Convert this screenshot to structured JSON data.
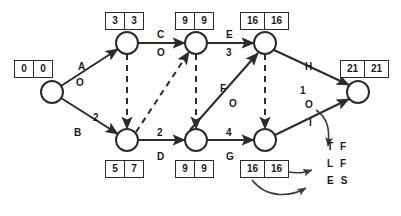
{
  "diagram": {
    "type": "cpm-network",
    "stroke_color": "#2b2b2b",
    "text_color": "#1a1a1a",
    "background": "#ffffff",
    "nodes": [
      {
        "id": "n1",
        "label": "",
        "x": 52,
        "y": 92,
        "r": 11
      },
      {
        "id": "n2",
        "label": "",
        "x": 127,
        "y": 43,
        "r": 11
      },
      {
        "id": "n3",
        "label": "",
        "x": 196,
        "y": 43,
        "r": 11
      },
      {
        "id": "n4",
        "label": "",
        "x": 265,
        "y": 43,
        "r": 11
      },
      {
        "id": "n5",
        "label": "",
        "x": 358,
        "y": 92,
        "r": 11
      },
      {
        "id": "n6",
        "label": "",
        "x": 127,
        "y": 140,
        "r": 11
      },
      {
        "id": "n7",
        "label": "",
        "x": 196,
        "y": 140,
        "r": 11
      },
      {
        "id": "n8",
        "label": "",
        "x": 265,
        "y": 140,
        "r": 11
      }
    ],
    "boxes": [
      {
        "id": "b1",
        "node": "n1",
        "early_start": "0",
        "late_finish": "0",
        "x": 14,
        "y": 60,
        "wide": false
      },
      {
        "id": "b2",
        "node": "n2",
        "early_start": "3",
        "late_finish": "3",
        "x": 105,
        "y": 12,
        "wide": false
      },
      {
        "id": "b3",
        "node": "n3",
        "early_start": "9",
        "late_finish": "9",
        "x": 175,
        "y": 12,
        "wide": false
      },
      {
        "id": "b4",
        "node": "n4",
        "early_start": "16",
        "late_finish": "16",
        "x": 240,
        "y": 12,
        "wide": true
      },
      {
        "id": "b5",
        "node": "n5",
        "early_start": "21",
        "late_finish": "21",
        "x": 340,
        "y": 60,
        "wide": true
      },
      {
        "id": "b6",
        "node": "n6",
        "early_start": "5",
        "late_finish": "7",
        "x": 105,
        "y": 160,
        "wide": false
      },
      {
        "id": "b7",
        "node": "n7",
        "early_start": "9",
        "late_finish": "9",
        "x": 175,
        "y": 160,
        "wide": false
      },
      {
        "id": "b8",
        "node": "n8",
        "early_start": "16",
        "late_finish": "16",
        "x": 240,
        "y": 160,
        "wide": true
      }
    ],
    "activities": [
      {
        "id": "A",
        "name": "A",
        "duration": "O",
        "from": "n1",
        "to": "n2",
        "style": "solid",
        "name_x": 78,
        "name_y": 62,
        "dur_x": 76,
        "dur_y": 78
      },
      {
        "id": "B",
        "name": "B",
        "duration": "2",
        "from": "n1",
        "to": "n6",
        "style": "solid",
        "name_x": 74,
        "name_y": 128,
        "dur_x": 93,
        "dur_y": 113
      },
      {
        "id": "C",
        "name": "C",
        "duration": "O",
        "from": "n2",
        "to": "n3",
        "style": "solid",
        "name_x": 157,
        "name_y": 30,
        "dur_x": 157,
        "dur_y": 48
      },
      {
        "id": "D",
        "name": "D",
        "duration": "2",
        "from": "n6",
        "to": "n7",
        "style": "solid",
        "name_x": 157,
        "name_y": 152,
        "dur_x": 157,
        "dur_y": 128
      },
      {
        "id": "E",
        "name": "E",
        "duration": "3",
        "from": "n3",
        "to": "n4",
        "style": "solid",
        "name_x": 226,
        "name_y": 30,
        "dur_x": 226,
        "dur_y": 48
      },
      {
        "id": "F",
        "name": "F",
        "duration": "O",
        "from": "n7",
        "to": "n4",
        "style": "solid",
        "name_x": 220,
        "name_y": 84,
        "dur_x": 229,
        "dur_y": 99
      },
      {
        "id": "G",
        "name": "G",
        "duration": "4",
        "from": "n7",
        "to": "n8",
        "style": "solid",
        "name_x": 226,
        "name_y": 152,
        "dur_x": 226,
        "dur_y": 128
      },
      {
        "id": "H",
        "name": "H",
        "duration": "1",
        "from": "n4",
        "to": "n5",
        "style": "solid",
        "name_x": 305,
        "name_y": 62,
        "dur_x": 300,
        "dur_y": 86
      },
      {
        "id": "I",
        "name": "I",
        "duration": "O",
        "from": "n8",
        "to": "n5",
        "style": "solid",
        "name_x": 309,
        "name_y": 118,
        "dur_x": 305,
        "dur_y": 100
      }
    ],
    "dummies": [
      {
        "id": "d1",
        "from": "n2",
        "to": "n6",
        "style": "dashed"
      },
      {
        "id": "d2",
        "from": "n6",
        "to": "n3",
        "style": "dashed"
      },
      {
        "id": "d3",
        "from": "n3",
        "to": "n7",
        "style": "dashed"
      },
      {
        "id": "d4",
        "from": "n4",
        "to": "n8",
        "style": "dashed"
      }
    ],
    "legend": {
      "x": 327,
      "y": 142,
      "rows": [
        {
          "id": "tf",
          "left": "T",
          "right": "F",
          "meaning": "total-float"
        },
        {
          "id": "lf",
          "left": "L",
          "right": "F",
          "meaning": "late-finish"
        },
        {
          "id": "es",
          "left": "E",
          "right": "S",
          "meaning": "early-start"
        }
      ]
    }
  }
}
